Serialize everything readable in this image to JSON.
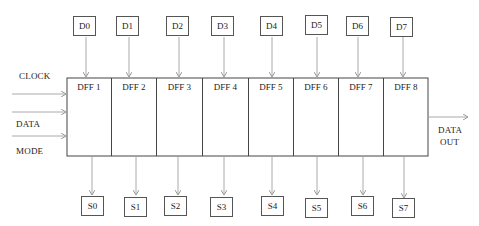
{
  "diagram": {
    "type": "shift-register-block-diagram",
    "inputs_top": [
      "D0",
      "D1",
      "D2",
      "D3",
      "D4",
      "D5",
      "D6",
      "D7"
    ],
    "flipflops": [
      "DFF 1",
      "DFF 2",
      "DFF 3",
      "DFF 4",
      "DFF 5",
      "DFF 6",
      "DFF 7",
      "DFF 8"
    ],
    "outputs_bottom": [
      "S0",
      "S1",
      "S2",
      "S3",
      "S4",
      "S5",
      "S6",
      "S7"
    ],
    "left_labels": {
      "clock": "CLOCK",
      "data": "DATA",
      "mode": "MODE"
    },
    "right_label": {
      "line1": "DATA",
      "line2": "OUT"
    },
    "colors": {
      "line": "#444444",
      "arrow": "#aaaaaa",
      "text": "#222222"
    }
  }
}
